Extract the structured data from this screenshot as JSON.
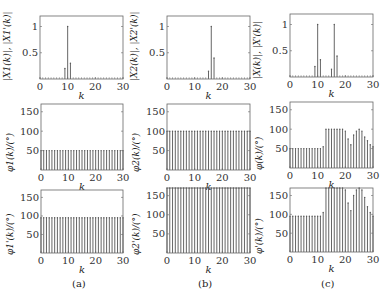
{
  "captions": {
    "a": "(a)",
    "b": "(b)",
    "c": "(c)"
  },
  "chart_data": [
    {
      "id": "a-mag",
      "type": "stem",
      "column": "a",
      "row": 0,
      "ylabel": "|X1(k)|, |X1'(k)|",
      "xlabel": "k",
      "xlim": [
        0,
        30
      ],
      "ylim": [
        0,
        1.2
      ],
      "xticks": [
        0,
        10,
        20,
        30
      ],
      "yticks": [
        0.5,
        1
      ],
      "ytick_labels": [
        "0.5",
        "1"
      ],
      "x": [
        0,
        1,
        2,
        3,
        4,
        5,
        6,
        7,
        8,
        9,
        10,
        11,
        12,
        13,
        14,
        15,
        16,
        17,
        18,
        19,
        20,
        21,
        22,
        23,
        24,
        25,
        26,
        27,
        28,
        29,
        30
      ],
      "values": [
        0,
        0,
        0,
        0,
        0,
        0,
        0,
        0,
        0,
        0.2,
        1.0,
        0.3,
        0,
        0,
        0,
        0,
        0,
        0,
        0,
        0,
        0,
        0,
        0,
        0,
        0,
        0,
        0,
        0,
        0,
        0,
        0
      ]
    },
    {
      "id": "b-mag",
      "type": "stem",
      "column": "b",
      "row": 0,
      "ylabel": "|X2(k)|, |X2'(k)|",
      "xlabel": "k",
      "xlim": [
        0,
        30
      ],
      "ylim": [
        0,
        1.2
      ],
      "xticks": [
        0,
        10,
        20,
        30
      ],
      "yticks": [
        0.5,
        1
      ],
      "ytick_labels": [
        "0.5",
        "1"
      ],
      "x": [
        0,
        1,
        2,
        3,
        4,
        5,
        6,
        7,
        8,
        9,
        10,
        11,
        12,
        13,
        14,
        15,
        16,
        17,
        18,
        19,
        20,
        21,
        22,
        23,
        24,
        25,
        26,
        27,
        28,
        29,
        30
      ],
      "values": [
        0,
        0,
        0,
        0,
        0,
        0,
        0,
        0,
        0,
        0,
        0,
        0,
        0,
        0,
        0,
        0.15,
        1.0,
        0.4,
        0,
        0,
        0,
        0,
        0,
        0,
        0,
        0,
        0,
        0,
        0,
        0,
        0
      ]
    },
    {
      "id": "c-mag",
      "type": "stem",
      "column": "c",
      "row": 0,
      "ylabel": "|X(k)|, |X'(k)|",
      "xlabel": "k",
      "xlim": [
        0,
        30
      ],
      "ylim": [
        0,
        1.2
      ],
      "xticks": [
        0,
        10,
        20,
        30
      ],
      "yticks": [
        0.5,
        1
      ],
      "ytick_labels": [
        "0.5",
        "1"
      ],
      "x": [
        0,
        1,
        2,
        3,
        4,
        5,
        6,
        7,
        8,
        9,
        10,
        11,
        12,
        13,
        14,
        15,
        16,
        17,
        18,
        19,
        20,
        21,
        22,
        23,
        24,
        25,
        26,
        27,
        28,
        29,
        30
      ],
      "values": [
        0,
        0,
        0,
        0,
        0,
        0,
        0,
        0,
        0,
        0.2,
        1.0,
        0.33,
        0,
        0,
        0,
        0.15,
        1.0,
        0.4,
        0,
        0,
        0,
        0,
        0,
        0,
        0,
        0,
        0,
        0,
        0,
        0,
        0
      ]
    },
    {
      "id": "a-phase",
      "type": "stem",
      "column": "a",
      "row": 1,
      "ylabel": "φ1(k)/(°)",
      "xlabel": "k",
      "xlim": [
        0,
        30
      ],
      "ylim": [
        0,
        170
      ],
      "xticks": [
        0,
        10,
        20,
        30
      ],
      "yticks": [
        50,
        100,
        150
      ],
      "ytick_labels": [
        "50",
        "100",
        "150"
      ],
      "x": [
        0,
        1,
        2,
        3,
        4,
        5,
        6,
        7,
        8,
        9,
        10,
        11,
        12,
        13,
        14,
        15,
        16,
        17,
        18,
        19,
        20,
        21,
        22,
        23,
        24,
        25,
        26,
        27,
        28,
        29,
        30
      ],
      "values": [
        50,
        50,
        50,
        50,
        50,
        50,
        50,
        50,
        50,
        50,
        50,
        50,
        50,
        50,
        50,
        50,
        50,
        50,
        50,
        50,
        50,
        50,
        50,
        50,
        50,
        50,
        50,
        50,
        50,
        50,
        50
      ]
    },
    {
      "id": "b-phase",
      "type": "stem",
      "column": "b",
      "row": 1,
      "ylabel": "φ2(k)/(°)",
      "xlabel": "k",
      "xlim": [
        0,
        30
      ],
      "ylim": [
        0,
        170
      ],
      "xticks": [
        0,
        10,
        20,
        30
      ],
      "yticks": [
        50,
        100,
        150
      ],
      "ytick_labels": [
        "50",
        "100",
        "150"
      ],
      "x": [
        0,
        1,
        2,
        3,
        4,
        5,
        6,
        7,
        8,
        9,
        10,
        11,
        12,
        13,
        14,
        15,
        16,
        17,
        18,
        19,
        20,
        21,
        22,
        23,
        24,
        25,
        26,
        27,
        28,
        29,
        30
      ],
      "values": [
        100,
        100,
        100,
        100,
        100,
        100,
        100,
        100,
        100,
        100,
        100,
        100,
        100,
        100,
        100,
        100,
        100,
        100,
        100,
        100,
        100,
        100,
        100,
        100,
        100,
        100,
        100,
        100,
        100,
        100,
        100
      ]
    },
    {
      "id": "c-phase",
      "type": "stem",
      "column": "c",
      "row": 1,
      "ylabel": "φ(k)/(°)",
      "xlabel": "k",
      "xlim": [
        0,
        30
      ],
      "ylim": [
        0,
        170
      ],
      "xticks": [
        0,
        10,
        20,
        30
      ],
      "yticks": [
        50,
        100,
        150
      ],
      "ytick_labels": [
        "50",
        "100",
        "150"
      ],
      "x": [
        0,
        1,
        2,
        3,
        4,
        5,
        6,
        7,
        8,
        9,
        10,
        11,
        12,
        13,
        14,
        15,
        16,
        17,
        18,
        19,
        20,
        21,
        22,
        23,
        24,
        25,
        26,
        27,
        28,
        29,
        30
      ],
      "values": [
        50,
        50,
        50,
        50,
        50,
        50,
        50,
        50,
        50,
        50,
        50,
        50,
        55,
        100,
        100,
        100,
        100,
        100,
        100,
        100,
        95,
        75,
        60,
        85,
        95,
        100,
        95,
        80,
        70,
        60,
        55
      ]
    },
    {
      "id": "a-phase2",
      "type": "stem",
      "column": "a",
      "row": 2,
      "ylabel": "φ1'(k)/(°)",
      "xlabel": "k",
      "xlim": [
        0,
        30
      ],
      "ylim": [
        0,
        170
      ],
      "xticks": [
        0,
        10,
        20,
        30
      ],
      "yticks": [
        50,
        100,
        150
      ],
      "ytick_labels": [
        "50",
        "100",
        "150"
      ],
      "x": [
        0,
        1,
        2,
        3,
        4,
        5,
        6,
        7,
        8,
        9,
        10,
        11,
        12,
        13,
        14,
        15,
        16,
        17,
        18,
        19,
        20,
        21,
        22,
        23,
        24,
        25,
        26,
        27,
        28,
        29,
        30
      ],
      "values": [
        95,
        95,
        95,
        95,
        95,
        95,
        95,
        95,
        95,
        95,
        95,
        95,
        95,
        95,
        95,
        95,
        95,
        95,
        95,
        95,
        95,
        95,
        95,
        95,
        95,
        95,
        95,
        95,
        95,
        95,
        95
      ]
    },
    {
      "id": "b-phase2",
      "type": "stem",
      "column": "b",
      "row": 2,
      "ylabel": "φ2'(k)/(°)",
      "xlabel": "k",
      "xlim": [
        0,
        30
      ],
      "ylim": [
        0,
        170
      ],
      "xticks": [
        0,
        10,
        20,
        30
      ],
      "yticks": [
        50,
        100,
        150
      ],
      "ytick_labels": [
        "50",
        "100",
        "150"
      ],
      "x": [
        0,
        1,
        2,
        3,
        4,
        5,
        6,
        7,
        8,
        9,
        10,
        11,
        12,
        13,
        14,
        15,
        16,
        17,
        18,
        19,
        20,
        21,
        22,
        23,
        24,
        25,
        26,
        27,
        28,
        29,
        30
      ],
      "values": [
        170,
        170,
        170,
        170,
        170,
        170,
        170,
        170,
        170,
        170,
        170,
        170,
        170,
        170,
        170,
        170,
        170,
        170,
        170,
        170,
        170,
        170,
        170,
        170,
        170,
        170,
        170,
        170,
        170,
        170,
        170
      ]
    },
    {
      "id": "c-phase2",
      "type": "stem",
      "column": "c",
      "row": 2,
      "ylabel": "φ'(k)/(°)",
      "xlabel": "k",
      "xlim": [
        0,
        30
      ],
      "ylim": [
        0,
        170
      ],
      "xticks": [
        0,
        10,
        20,
        30
      ],
      "yticks": [
        50,
        100,
        150
      ],
      "ytick_labels": [
        "50",
        "100",
        "150"
      ],
      "x": [
        0,
        1,
        2,
        3,
        4,
        5,
        6,
        7,
        8,
        9,
        10,
        11,
        12,
        13,
        14,
        15,
        16,
        17,
        18,
        19,
        20,
        21,
        22,
        23,
        24,
        25,
        26,
        27,
        28,
        29,
        30
      ],
      "values": [
        95,
        95,
        95,
        95,
        95,
        95,
        95,
        95,
        95,
        95,
        95,
        95,
        105,
        170,
        170,
        170,
        170,
        170,
        170,
        170,
        165,
        130,
        110,
        150,
        165,
        170,
        165,
        145,
        120,
        105,
        95
      ]
    }
  ]
}
